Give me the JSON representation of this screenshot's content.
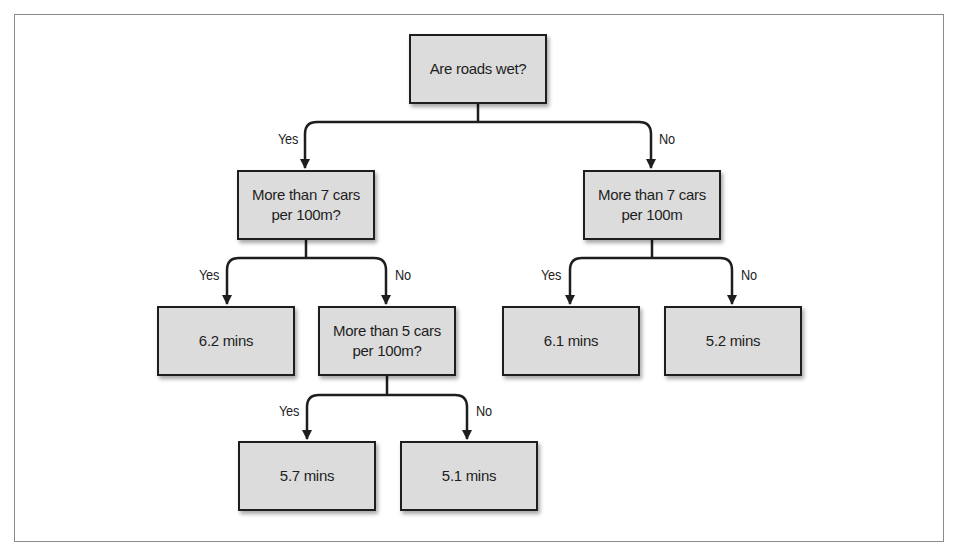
{
  "diagram": {
    "type": "decision-tree",
    "nodes": {
      "root": {
        "text": "Are roads wet?"
      },
      "wet_traffic": {
        "text": "More than 7 cars\nper 100m?"
      },
      "dry_traffic": {
        "text": "More than 7 cars\nper 100m"
      },
      "wet_heavy_leaf": {
        "text": "6.2 mins"
      },
      "wet_light_check": {
        "text": "More than 5 cars\nper 100m?"
      },
      "dry_heavy_leaf": {
        "text": "6.1 mins"
      },
      "dry_light_leaf": {
        "text": "5.2 mins"
      },
      "wet_medium_leaf": {
        "text": "5.7 mins"
      },
      "wet_verylight_leaf": {
        "text": "5.1 mins"
      }
    },
    "edges": [
      {
        "from": "root",
        "to": "wet_traffic",
        "label": "Yes"
      },
      {
        "from": "root",
        "to": "dry_traffic",
        "label": "No"
      },
      {
        "from": "wet_traffic",
        "to": "wet_heavy_leaf",
        "label": "Yes"
      },
      {
        "from": "wet_traffic",
        "to": "wet_light_check",
        "label": "No"
      },
      {
        "from": "dry_traffic",
        "to": "dry_heavy_leaf",
        "label": "Yes"
      },
      {
        "from": "dry_traffic",
        "to": "dry_light_leaf",
        "label": "No"
      },
      {
        "from": "wet_light_check",
        "to": "wet_medium_leaf",
        "label": "Yes"
      },
      {
        "from": "wet_light_check",
        "to": "wet_verylight_leaf",
        "label": "No"
      }
    ],
    "colors": {
      "node_fill": "#dcdcdc",
      "node_border": "#1e1e1e",
      "line": "#1e1e1e",
      "frame": "#8a8a8a"
    }
  }
}
